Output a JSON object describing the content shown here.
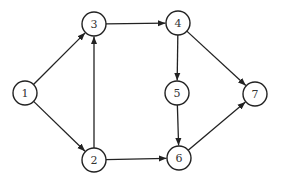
{
  "diagram": {
    "type": "directed-graph",
    "colors": {
      "stroke": "#222222",
      "node_fill": "#ffffff",
      "label": "#333333",
      "background": "#ffffff"
    },
    "node_radius": 12,
    "nodes": [
      {
        "id": "1",
        "label": "1",
        "x": 25,
        "y": 93
      },
      {
        "id": "2",
        "label": "2",
        "x": 94,
        "y": 160
      },
      {
        "id": "3",
        "label": "3",
        "x": 94,
        "y": 24
      },
      {
        "id": "4",
        "label": "4",
        "x": 178,
        "y": 23
      },
      {
        "id": "5",
        "label": "5",
        "x": 177,
        "y": 93
      },
      {
        "id": "6",
        "label": "6",
        "x": 179,
        "y": 158
      },
      {
        "id": "7",
        "label": "7",
        "x": 255,
        "y": 94
      }
    ],
    "edges": [
      {
        "from": "1",
        "to": "3"
      },
      {
        "from": "1",
        "to": "2"
      },
      {
        "from": "2",
        "to": "3"
      },
      {
        "from": "3",
        "to": "4"
      },
      {
        "from": "2",
        "to": "6"
      },
      {
        "from": "4",
        "to": "5"
      },
      {
        "from": "4",
        "to": "7"
      },
      {
        "from": "5",
        "to": "6"
      },
      {
        "from": "6",
        "to": "7"
      }
    ]
  }
}
